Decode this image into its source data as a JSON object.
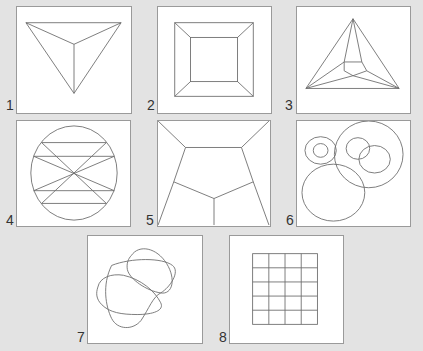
{
  "figure": {
    "background": "#e3e3e3",
    "panels": [
      {
        "label": "1",
        "shape": "triangle-projected-to-center-point"
      },
      {
        "label": "2",
        "shape": "nested-squares-frustum"
      },
      {
        "label": "3",
        "shape": "triangle-with-inner-pentagon-subdivision"
      },
      {
        "label": "4",
        "shape": "circle-with-horizontal-and-crossing-chords"
      },
      {
        "label": "5",
        "shape": "square-with-inner-pentagon-subdivision"
      },
      {
        "label": "6",
        "shape": "overlapping-circles"
      },
      {
        "label": "7",
        "shape": "overlapping-closed-curves"
      },
      {
        "label": "8",
        "shape": "4x5-grid"
      }
    ]
  }
}
